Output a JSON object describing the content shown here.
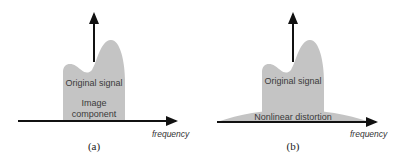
{
  "panels": [
    {
      "caption": "(a)",
      "signal_label": "Original signal",
      "component_label_line1": "Image",
      "component_label_line2": "component",
      "axis_label": "frequency"
    },
    {
      "caption": "(b)",
      "signal_label": "Original signal",
      "component_label": "Nonlinear distortion",
      "axis_label": "frequency"
    }
  ],
  "colors": {
    "shape_fill": "#c4c4c4",
    "axis": "#111111",
    "background": "#ffffff"
  }
}
